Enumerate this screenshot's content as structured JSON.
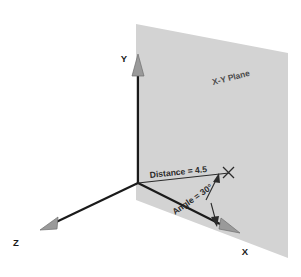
{
  "figure": {
    "type": "3d-axes-diagram",
    "background_color": "#ffffff"
  },
  "plane": {
    "label": "X-Y Plane",
    "fill_color": "#d3d3d3",
    "label_rotation_deg": -14
  },
  "axes": [
    {
      "name": "y-axis",
      "label": "Y",
      "direction": "up",
      "color": "#1a1a1a",
      "arrowhead_color": "#9a9a9a"
    },
    {
      "name": "x-axis",
      "label": "X",
      "direction": "down-right",
      "color": "#1a1a1a",
      "arrowhead_color": "#9a9a9a"
    },
    {
      "name": "z-axis",
      "label": "Z",
      "direction": "down-left",
      "color": "#1a1a1a",
      "arrowhead_color": "#9a9a9a"
    }
  ],
  "annotations": {
    "distance": {
      "label": "Distance = 4.5",
      "value": 4.5,
      "rotation_deg": -6,
      "line_color": "#2b2b2b",
      "endpoint_marker": "cross-tick"
    },
    "angle": {
      "label": "Angle = 30°",
      "value": 30,
      "unit": "degrees",
      "rotation_deg": -35,
      "line_color": "#2b2b2b",
      "arrow_style": "double-headed"
    }
  },
  "geometry": {
    "origin": {
      "x": 138,
      "y": 183
    },
    "y_tip": {
      "x": 138,
      "y": 55
    },
    "x_tip": {
      "x": 237,
      "y": 230
    },
    "z_tip": {
      "x": 42,
      "y": 227
    },
    "distance_tip": {
      "x": 229,
      "y": 172
    }
  }
}
